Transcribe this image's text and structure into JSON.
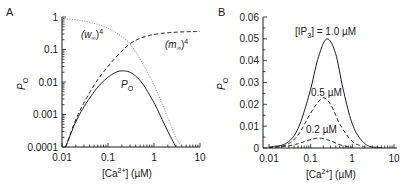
{
  "chart_data": [
    {
      "panel": "A",
      "type": "line",
      "xscale": "log",
      "yscale": "log",
      "xlabel": "[Ca2+] (µM)",
      "ylabel": "PO",
      "xlim": [
        0.01,
        10
      ],
      "ylim": [
        0.0001,
        1
      ],
      "xticks": [
        "0.01",
        "0.1",
        "1",
        "10"
      ],
      "yticks": [
        "0.0001",
        "0.001",
        "0.01",
        "0.1",
        "1"
      ],
      "grid": false,
      "series": [
        {
          "name": "(w∞)^4",
          "style": "dotted",
          "x": [
            0.01,
            0.03,
            0.1,
            0.2,
            0.3,
            0.5,
            1,
            2,
            3,
            4
          ],
          "values": [
            0.9,
            0.75,
            0.45,
            0.25,
            0.15,
            0.05,
            0.008,
            0.0008,
            0.0002,
            0.0001
          ]
        },
        {
          "name": "(m∞)^4",
          "style": "dashed",
          "x": [
            0.012,
            0.02,
            0.05,
            0.1,
            0.2,
            0.3,
            0.5,
            1,
            3,
            10
          ],
          "values": [
            0.0001,
            0.0007,
            0.008,
            0.03,
            0.09,
            0.15,
            0.22,
            0.29,
            0.34,
            0.36
          ]
        },
        {
          "name": "PO",
          "style": "solid",
          "x": [
            0.012,
            0.02,
            0.05,
            0.1,
            0.2,
            0.3,
            0.5,
            1,
            2,
            3
          ],
          "values": [
            0.0001,
            0.0006,
            0.005,
            0.014,
            0.022,
            0.02,
            0.011,
            0.0023,
            0.0003,
            0.0001
          ]
        }
      ],
      "annotations": [
        "(w∞)4",
        "(m∞)4",
        "PO"
      ]
    },
    {
      "panel": "B",
      "type": "line",
      "xscale": "log",
      "yscale": "linear",
      "xlabel": "[Ca2+] (µM)",
      "ylabel": "PO",
      "xlim": [
        0.01,
        10
      ],
      "ylim": [
        0,
        0.06
      ],
      "xticks": [
        "0.01",
        "0.1",
        "1",
        "10"
      ],
      "yticks": [
        "0",
        "0.01",
        "0.02",
        "0.03",
        "0.04",
        "0.05",
        "0.06"
      ],
      "grid": false,
      "series": [
        {
          "name": "[IP3] = 1.0 µM",
          "style": "solid",
          "x": [
            0.01,
            0.03,
            0.05,
            0.1,
            0.15,
            0.25,
            0.4,
            0.6,
            1,
            2,
            5
          ],
          "values": [
            0.0003,
            0.003,
            0.009,
            0.027,
            0.041,
            0.05,
            0.043,
            0.027,
            0.011,
            0.002,
            0.0001
          ]
        },
        {
          "name": "0.5 µM",
          "style": "dashed",
          "x": [
            0.01,
            0.03,
            0.05,
            0.1,
            0.15,
            0.2,
            0.3,
            0.5,
            1,
            2
          ],
          "values": [
            0.0002,
            0.002,
            0.006,
            0.016,
            0.021,
            0.023,
            0.02,
            0.011,
            0.003,
            0.0004
          ]
        },
        {
          "name": "0.2 µM",
          "style": "dashed",
          "x": [
            0.01,
            0.03,
            0.05,
            0.1,
            0.15,
            0.2,
            0.3,
            0.5,
            1
          ],
          "values": [
            0.0001,
            0.001,
            0.002,
            0.0038,
            0.0045,
            0.0043,
            0.0033,
            0.0015,
            0.0003
          ]
        }
      ],
      "annotations": [
        "[IP3] = 1.0 µM",
        "0.5 µM",
        "0.2 µM"
      ]
    }
  ],
  "panels": {
    "A": {
      "label": "A",
      "ylabel_main": "P",
      "ylabel_sub": "O",
      "xlabel_pre": "[Ca",
      "xlabel_sup": "2+",
      "xlabel_post": "] (µM)",
      "xticks": [
        "0.01",
        "0.1",
        "1",
        "10"
      ],
      "yticks": [
        "1",
        "0.1",
        "0.01",
        "0.001",
        "0.0001"
      ],
      "w_label_main": "(w",
      "w_label_sub": "∞",
      "w_label_close": ")",
      "w_label_sup": "4",
      "m_label_main": "(m",
      "m_label_sub": "∞",
      "m_label_close": ")",
      "m_label_sup": "4",
      "po_label_main": "P",
      "po_label_sub": "O"
    },
    "B": {
      "label": "B",
      "ylabel_main": "P",
      "ylabel_sub": "O",
      "xlabel_pre": "[Ca",
      "xlabel_sup": "2+",
      "xlabel_post": "] (µM)",
      "xticks": [
        "0.01",
        "0.1",
        "1",
        "10"
      ],
      "yticks": [
        "0.06",
        "0.05",
        "0.04",
        "0.03",
        "0.02",
        "0.01",
        "0"
      ],
      "ip3_pre": "[IP",
      "ip3_sub": "3",
      "ip3_post": "] = 1.0 µM",
      "label_05": "0.5 µM",
      "label_02": "0.2 µM"
    }
  }
}
